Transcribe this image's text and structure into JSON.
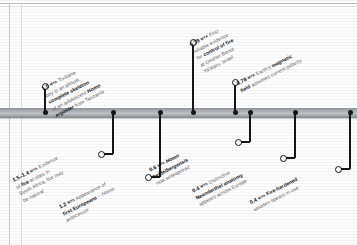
{
  "figure": {
    "type": "timeline",
    "orientation": "horizontal",
    "unit_label": "MYA",
    "bar_color": "#a9acb0",
    "node_color": "#161616",
    "text_color": "#5d6166",
    "emphasis_color": "#111417"
  },
  "events": [
    {
      "id": "turkana-boy",
      "age": "1.5",
      "unit": "MYA",
      "side": "above",
      "lines": [
        {
          "parts": [
            {
              "t": "Turkana",
              "style": "plain"
            }
          ]
        },
        {
          "parts": [
            {
              "t": "boy",
              "style": "italic"
            },
            {
              "t": " is an almost",
              "style": "plain"
            }
          ]
        },
        {
          "parts": [
            {
              "t": "complete skeleton",
              "style": "bold"
            }
          ]
        },
        {
          "parts": [
            {
              "t": "of an adolescent ",
              "style": "plain"
            },
            {
              "t": "Homo",
              "style": "bold-italic"
            }
          ]
        },
        {
          "parts": [
            {
              "t": "ergaster",
              "style": "bold-italic"
            },
            {
              "t": " from Tanzania",
              "style": "plain"
            }
          ]
        }
      ],
      "text_plain": "1.5 MYA Turkana boy is an almost complete skeleton of an adolescent Homo ergaster from Tanzania"
    },
    {
      "id": "fire-south-africa",
      "age": "1.5–1.4",
      "unit": "MYA",
      "side": "below",
      "lines": [
        {
          "parts": [
            {
              "t": "Evidence",
              "style": "plain"
            }
          ]
        },
        {
          "parts": [
            {
              "t": "of ",
              "style": "plain"
            },
            {
              "t": "fire",
              "style": "bold"
            },
            {
              "t": " at sites in",
              "style": "plain"
            }
          ]
        },
        {
          "parts": [
            {
              "t": "South Africa, but may",
              "style": "plain"
            }
          ]
        },
        {
          "parts": [
            {
              "t": "be natural",
              "style": "plain"
            }
          ]
        }
      ],
      "text_plain": "1.5–1.4 MYA Evidence of fire at sites in South Africa, but may be natural"
    },
    {
      "id": "first-europeans",
      "age": "1.2",
      "unit": "MYA",
      "side": "below",
      "lines": [
        {
          "parts": [
            {
              "t": "Appearance of",
              "style": "plain"
            }
          ]
        },
        {
          "parts": [
            {
              "t": "first Europeans",
              "style": "bold"
            },
            {
              "t": " – ",
              "style": "plain"
            },
            {
              "t": "Homo",
              "style": "italic"
            }
          ]
        },
        {
          "parts": [
            {
              "t": "antecessor",
              "style": "italic"
            }
          ]
        }
      ],
      "text_plain": "1.2 MYA Appearance of first Europeans – Homo antecessor"
    },
    {
      "id": "control-of-fire",
      "age": "0.79",
      "unit": "MYA",
      "side": "above",
      "lines": [
        {
          "parts": [
            {
              "t": "First",
              "style": "plain"
            }
          ]
        },
        {
          "parts": [
            {
              "t": "reliable evidence",
              "style": "plain"
            }
          ]
        },
        {
          "parts": [
            {
              "t": "for ",
              "style": "plain"
            },
            {
              "t": "control of fire",
              "style": "bold"
            }
          ]
        },
        {
          "parts": [
            {
              "t": "at Gesher Benot",
              "style": "plain"
            }
          ]
        },
        {
          "parts": [
            {
              "t": "Ya'aqov, Israel",
              "style": "plain"
            }
          ]
        }
      ],
      "text_plain": "0.79 MYA First reliable evidence for control of fire at Gesher Benot Ya'aqov, Israel"
    },
    {
      "id": "magnetic-polarity",
      "age": "0.78",
      "unit": "MYA",
      "side": "above",
      "lines": [
        {
          "parts": [
            {
              "t": "Earth's ",
              "style": "plain"
            },
            {
              "t": "magnetic",
              "style": "bold"
            }
          ]
        },
        {
          "parts": [
            {
              "t": "field",
              "style": "bold"
            },
            {
              "t": " assumes current polarity",
              "style": "plain"
            }
          ]
        }
      ],
      "text_plain": "0.78 MYA Earth's magnetic field assumes current polarity"
    },
    {
      "id": "heidelbergensis",
      "age": "0.6",
      "unit": "MYA",
      "side": "below",
      "lines": [
        {
          "parts": [
            {
              "t": "Homo",
              "style": "bold-italic"
            }
          ]
        },
        {
          "parts": [
            {
              "t": "heidelbergensis",
              "style": "bold-italic"
            }
          ]
        },
        {
          "parts": [
            {
              "t": "now widespread",
              "style": "plain"
            }
          ]
        }
      ],
      "text_plain": "0.6 MYA Homo heidelbergensis now widespread"
    },
    {
      "id": "neanderthal-anatomy",
      "age": "0.4",
      "unit": "MYA",
      "side": "below",
      "lines": [
        {
          "parts": [
            {
              "t": "Distinctive",
              "style": "plain"
            }
          ]
        },
        {
          "parts": [
            {
              "t": "Neanderthal anatomy",
              "style": "bold"
            }
          ]
        },
        {
          "parts": [
            {
              "t": "appears across Europe",
              "style": "plain"
            }
          ]
        }
      ],
      "text_plain": "0.4 MYA Distinctive Neanderthal anatomy appears across Europe"
    },
    {
      "id": "fire-hardened-spears",
      "age": "0.4",
      "unit": "MYA",
      "side": "below",
      "lines": [
        {
          "parts": [
            {
              "t": "Fire-hardened",
              "style": "bold"
            }
          ]
        },
        {
          "parts": [
            {
              "t": "wooden spears in use",
              "style": "plain"
            }
          ]
        }
      ],
      "text_plain": "0.4 MYA Fire-hardened wooden spears in use"
    }
  ],
  "node_positions": [
    45,
    113,
    160,
    193,
    235,
    250,
    295,
    350
  ]
}
